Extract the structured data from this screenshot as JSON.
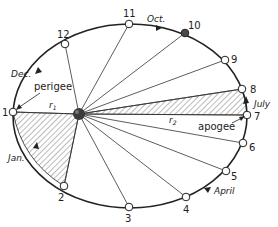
{
  "diagram": {
    "orbit_points": [
      {
        "label": "1",
        "x": 13,
        "y": 112,
        "lx": 2,
        "ly": 116
      },
      {
        "label": "2",
        "x": 64,
        "y": 186,
        "lx": 59,
        "ly": 201
      },
      {
        "label": "3",
        "x": 129,
        "y": 207,
        "lx": 125,
        "ly": 222
      },
      {
        "label": "4",
        "x": 186,
        "y": 197,
        "lx": 184,
        "ly": 212
      },
      {
        "label": "5",
        "x": 226,
        "y": 171,
        "lx": 232,
        "ly": 180
      },
      {
        "label": "6",
        "x": 243,
        "y": 143,
        "lx": 250,
        "ly": 150
      },
      {
        "label": "7",
        "x": 247,
        "y": 115,
        "lx": 254,
        "ly": 120
      },
      {
        "label": "8",
        "x": 242,
        "y": 89,
        "lx": 250,
        "ly": 92
      },
      {
        "label": "9",
        "x": 225,
        "y": 60,
        "lx": 232,
        "ly": 62
      },
      {
        "label": "10",
        "x": 185,
        "y": 33,
        "lx": 187,
        "ly": 28
      },
      {
        "label": "11",
        "x": 129,
        "y": 24,
        "lx": 124,
        "ly": 17
      },
      {
        "label": "12",
        "x": 65,
        "y": 44,
        "lx": 58,
        "ly": 38
      }
    ],
    "sun": {
      "x": 79,
      "y": 114
    },
    "labels": {
      "dec": "Dec.",
      "jan": "Jan.",
      "oct": "Oct.",
      "july": "July",
      "april": "April",
      "perigee": "perigee",
      "apogee": "apogee",
      "r1": "r",
      "r1_sub": "1",
      "r2": "r",
      "r2_sub": "2"
    },
    "colors": {
      "line": "#222222",
      "hatch": "#555555",
      "sun": "#3a3a3a",
      "earth": "#4a4a4a"
    }
  }
}
